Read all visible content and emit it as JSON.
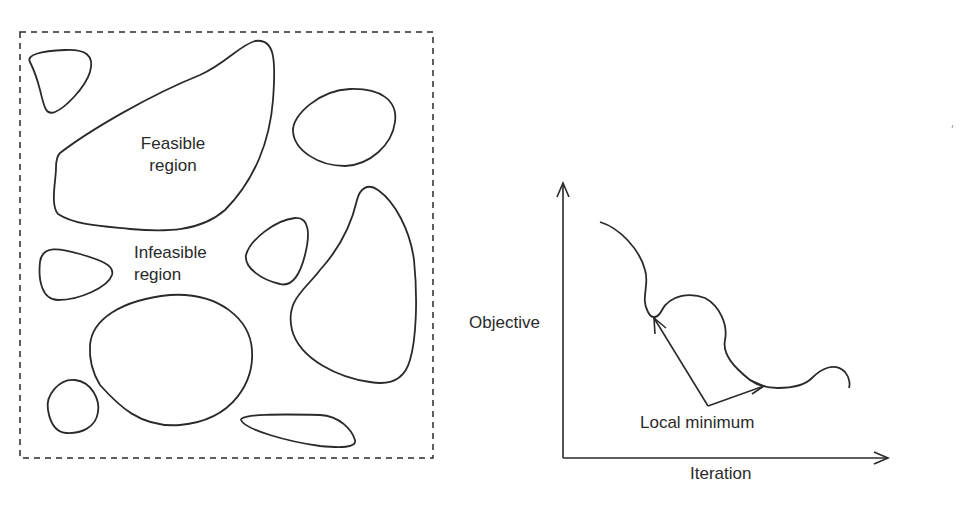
{
  "left_panel": {
    "title": "Feasible and infeasible regions",
    "feasible_label_line1": "Feasible",
    "feasible_label_line2": "region",
    "infeasible_label_line1": "Infeasible",
    "infeasible_label_line2": "region",
    "border_style": "dashed",
    "region_count": 10
  },
  "right_panel": {
    "y_axis_label": "Objective",
    "x_axis_label": "Iteration",
    "annotation": "Local minimum"
  },
  "colors": {
    "stroke": "#2a2a2a",
    "background": "#ffffff"
  }
}
